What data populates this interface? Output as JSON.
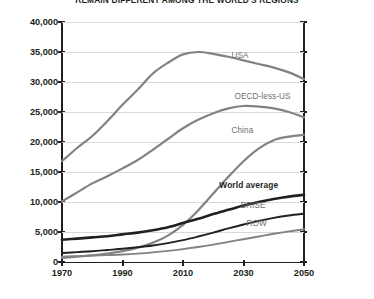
{
  "chart_data": {
    "type": "line",
    "title": "REMAIN DIFFERENT AMONG THE WORLD'S REGIONS",
    "xlabel": "",
    "ylabel": "",
    "xlim": [
      1970,
      2050
    ],
    "ylim": [
      0,
      40000
    ],
    "grid": true,
    "legend_position": "inline-right-labels",
    "x_ticks": [
      "1970",
      "1990",
      "2010",
      "2030",
      "2050"
    ],
    "y_ticks": [
      "0",
      "5,000",
      "10,000",
      "15,000",
      "20,000",
      "25,000",
      "30,000",
      "35,000",
      "40,000"
    ],
    "x": [
      1970,
      1975,
      1980,
      1985,
      1990,
      1995,
      2000,
      2005,
      2010,
      2015,
      2020,
      2025,
      2030,
      2035,
      2040,
      2045,
      2050
    ],
    "series": [
      {
        "name": "USA",
        "color": "#808285",
        "width": 2.2,
        "values": [
          16800,
          19000,
          21000,
          23500,
          26200,
          28700,
          31400,
          33200,
          34600,
          35000,
          34700,
          34200,
          33600,
          33000,
          32400,
          31600,
          30500
        ]
      },
      {
        "name": "OECD-less-US",
        "color": "#808285",
        "width": 2.2,
        "values": [
          10100,
          11600,
          13100,
          14300,
          15600,
          17000,
          18700,
          20500,
          22300,
          23700,
          24800,
          25600,
          26000,
          25900,
          25600,
          25000,
          24100
        ]
      },
      {
        "name": "China",
        "color": "#808285",
        "width": 2.2,
        "values": [
          700,
          900,
          1100,
          1400,
          1800,
          2400,
          3200,
          4400,
          6200,
          8600,
          11400,
          14200,
          16800,
          18900,
          20300,
          20900,
          21200
        ]
      },
      {
        "name": "World average",
        "color": "#231f20",
        "width": 2.6,
        "values": [
          3700,
          3900,
          4100,
          4300,
          4600,
          4900,
          5300,
          5800,
          6500,
          7200,
          8000,
          8700,
          9400,
          10000,
          10500,
          10900,
          11200
        ]
      },
      {
        "name": "BRISE",
        "color": "#231f20",
        "width": 1.9,
        "values": [
          1500,
          1650,
          1800,
          2000,
          2200,
          2450,
          2750,
          3150,
          3650,
          4250,
          4900,
          5600,
          6250,
          6850,
          7350,
          7750,
          8050
        ]
      },
      {
        "name": "ROW",
        "color": "#808285",
        "width": 1.9,
        "values": [
          900,
          980,
          1060,
          1150,
          1250,
          1400,
          1600,
          1850,
          2150,
          2500,
          2900,
          3350,
          3800,
          4250,
          4700,
          5100,
          5450
        ]
      }
    ],
    "annotations": [
      {
        "text": "USA",
        "x": 2026,
        "y": 34300
      },
      {
        "text": "OECD-less-US",
        "x": 2027,
        "y": 27500
      },
      {
        "text": "China",
        "x": 2026,
        "y": 21800
      },
      {
        "text": "World average",
        "x": 2022,
        "y": 12600
      },
      {
        "text": "BRISE",
        "x": 2029,
        "y": 9300
      },
      {
        "text": "ROW",
        "x": 2031,
        "y": 6300
      }
    ]
  }
}
